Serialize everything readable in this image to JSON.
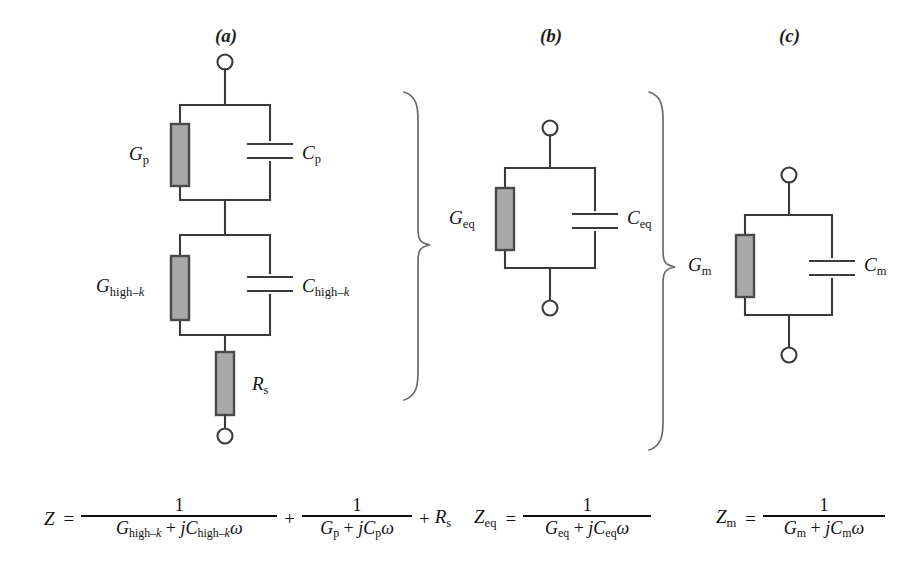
{
  "figure": {
    "type": "circuit-diagram",
    "background_color": "#ffffff",
    "line_color": "#3a3a3a",
    "resistor_fill": "#a9a9a9",
    "resistor_stroke": "#4a4a4a",
    "terminal_fill": "#ffffff"
  },
  "panels": [
    {
      "id": "a",
      "label": "(a)"
    },
    {
      "id": "b",
      "label": "(b)"
    },
    {
      "id": "c",
      "label": "(c)"
    }
  ],
  "circuit_a": {
    "description": "Two parallel G-C blocks in series with a series resistance",
    "blocks": [
      {
        "conductance": {
          "symbol": "G",
          "subscript": "p",
          "text": "Gp"
        },
        "capacitance": {
          "symbol": "C",
          "subscript": "p",
          "text": "Cp"
        }
      },
      {
        "conductance": {
          "symbol": "G",
          "subscript": "high-k",
          "text": "Ghigh-k"
        },
        "capacitance": {
          "symbol": "C",
          "subscript": "high-k",
          "text": "Chigh-k"
        }
      }
    ],
    "series_resistor": {
      "symbol": "R",
      "subscript": "s",
      "text": "Rs"
    },
    "terminals": 2
  },
  "circuit_b": {
    "description": "Single equivalent parallel G-C block",
    "conductance": {
      "symbol": "G",
      "subscript": "eq",
      "text": "Geq"
    },
    "capacitance": {
      "symbol": "C",
      "subscript": "eq",
      "text": "Ceq"
    },
    "terminals": 2
  },
  "circuit_c": {
    "description": "Measured parallel G-C block",
    "conductance": {
      "symbol": "G",
      "subscript": "m",
      "text": "Gm"
    },
    "capacitance": {
      "symbol": "C",
      "subscript": "m",
      "text": "Cm"
    },
    "terminals": 2
  },
  "braces": [
    {
      "id": "brace-a-to-b",
      "direction": "right",
      "spans": "circuit-a to circuit-b"
    },
    {
      "id": "brace-b-to-c",
      "direction": "right",
      "spans": "circuit-b to circuit-c"
    }
  ],
  "equations": {
    "eq1": {
      "lhs": "Z",
      "lhs_sub": "",
      "terms": [
        {
          "numerator": "1",
          "denominator_parts": [
            "G",
            "high-k",
            "+",
            "j",
            "C",
            "high-k",
            "ω"
          ],
          "denominator_text": "Ghigh-k + jChigh-kω"
        },
        {
          "numerator": "1",
          "denominator_parts": [
            "G",
            "p",
            "+",
            "j",
            "C",
            "p",
            "ω"
          ],
          "denominator_text": "Gp + jCpω"
        }
      ],
      "trailing_term": "Rs",
      "plain_text": "Z = 1/(Ghigh-k + jChigh-kω) + 1/(Gp + jCpω) + Rs"
    },
    "eq2": {
      "lhs": "Z",
      "lhs_sub": "eq",
      "numerator": "1",
      "denominator_text": "Geq + jCeqω",
      "plain_text": "Zeq = 1/(Geq + jCeqω)"
    },
    "eq3": {
      "lhs": "Z",
      "lhs_sub": "m",
      "numerator": "1",
      "denominator_text": "Gm + jCmω",
      "plain_text": "Zm = 1/(Gm + jCmω)"
    },
    "symbols": {
      "plus": "+",
      "equals": "=",
      "omega": "ω",
      "imaginary_unit": "j",
      "one": "1"
    }
  }
}
